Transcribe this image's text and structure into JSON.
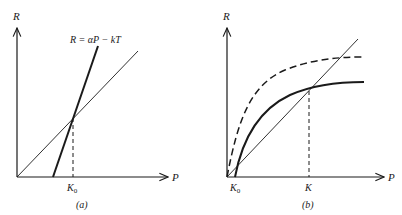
{
  "figure": {
    "panels": [
      {
        "id": "a",
        "caption": "(a)",
        "y_axis_label": "R",
        "x_axis_label": "P",
        "equation": "R = αP − kT",
        "x_tick_label": "K",
        "x_tick_subscript": "0",
        "lines": [
          {
            "name": "reference-line",
            "style": "thin",
            "description": "line through origin"
          },
          {
            "name": "steep-line",
            "style": "thick",
            "description": "R = αP − kT"
          }
        ]
      },
      {
        "id": "b",
        "caption": "(b)",
        "y_axis_label": "R",
        "x_axis_label": "P",
        "x_tick_labels": [
          {
            "main": "K",
            "subscript": "0"
          },
          {
            "main": "K",
            "subscript": ""
          }
        ],
        "lines": [
          {
            "name": "reference-line",
            "style": "thin"
          },
          {
            "name": "solid-saturating-curve",
            "style": "thick"
          },
          {
            "name": "dashed-saturating-curve",
            "style": "dashed"
          }
        ]
      }
    ],
    "colors": {
      "ink": "#1a1a1a",
      "background": "#ffffff"
    }
  }
}
